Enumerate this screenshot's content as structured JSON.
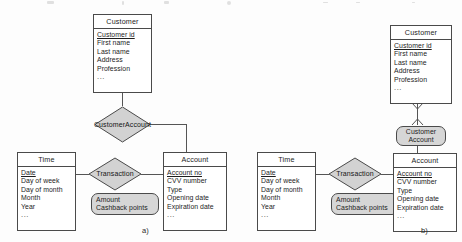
{
  "figure": {
    "captions": [
      {
        "id": "a",
        "label": "a)"
      },
      {
        "id": "b",
        "label": "b)"
      }
    ]
  },
  "diagram_a": {
    "entities": [
      {
        "name": "customer",
        "title": "Customer",
        "attributes": [
          {
            "text": "Customer id",
            "key": true
          },
          {
            "text": "First name",
            "key": false
          },
          {
            "text": "Last name",
            "key": false
          },
          {
            "text": "Address",
            "key": false
          },
          {
            "text": "Profession",
            "key": false
          },
          {
            "text": "...",
            "key": false
          }
        ]
      },
      {
        "name": "time",
        "title": "Time",
        "attributes": [
          {
            "text": "Date",
            "key": true
          },
          {
            "text": "Day of week",
            "key": false
          },
          {
            "text": "Day of month",
            "key": false
          },
          {
            "text": "Month",
            "key": false
          },
          {
            "text": "Year",
            "key": false
          },
          {
            "text": "...",
            "key": false
          }
        ]
      },
      {
        "name": "account",
        "title": "Account",
        "attributes": [
          {
            "text": "Account  no",
            "key": true
          },
          {
            "text": "CVV number",
            "key": false
          },
          {
            "text": "Type",
            "key": false
          },
          {
            "text": "Opening date",
            "key": false
          },
          {
            "text": "Expiration date",
            "key": false
          },
          {
            "text": "...",
            "key": false
          }
        ]
      }
    ],
    "relationships": [
      {
        "name": "customer-account",
        "shape": "diamond",
        "line1": "Customer",
        "line2": "Account"
      },
      {
        "name": "transaction",
        "shape": "diamond",
        "line1": "Transaction",
        "line2": ""
      }
    ],
    "relationship_attributes": {
      "name": "transaction-attributes",
      "items": [
        "Amount",
        "Cashback points"
      ]
    }
  },
  "diagram_b": {
    "entities": [
      {
        "name": "customer",
        "title": "Customer",
        "attributes": [
          {
            "text": "Customer id",
            "key": true
          },
          {
            "text": "First name",
            "key": false
          },
          {
            "text": "Last name",
            "key": false
          },
          {
            "text": "Address",
            "key": false
          },
          {
            "text": "Profession",
            "key": false
          },
          {
            "text": "...",
            "key": false
          }
        ]
      },
      {
        "name": "time",
        "title": "Time",
        "attributes": [
          {
            "text": "Date",
            "key": true
          },
          {
            "text": "Day of week",
            "key": false
          },
          {
            "text": "Day of month",
            "key": false
          },
          {
            "text": "Month",
            "key": false
          },
          {
            "text": "Year",
            "key": false
          },
          {
            "text": "...",
            "key": false
          }
        ]
      },
      {
        "name": "account",
        "title": "Account",
        "attributes": [
          {
            "text": "Account  no",
            "key": true
          },
          {
            "text": "CVV number",
            "key": false
          },
          {
            "text": "Type",
            "key": false
          },
          {
            "text": "Opening date",
            "key": false
          },
          {
            "text": "Expiration date",
            "key": false
          },
          {
            "text": "...",
            "key": false
          }
        ]
      }
    ],
    "relationships": [
      {
        "name": "customer-account",
        "shape": "rounded",
        "line1": "Customer",
        "line2": "Account"
      },
      {
        "name": "transaction",
        "shape": "diamond",
        "line1": "Transaction",
        "line2": ""
      }
    ],
    "relationship_attributes": {
      "name": "transaction-attributes",
      "items": [
        "Amount",
        "Cashback points"
      ]
    }
  },
  "colors": {
    "stroke": "#4a4a4a",
    "line": "#555555",
    "shape_fill": "#d6d6d6",
    "entity_fill": "#ffffff",
    "text": "#1d1d1d",
    "page": "#fdfdfd"
  }
}
